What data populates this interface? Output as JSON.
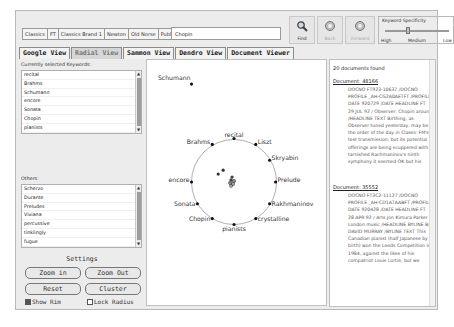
{
  "toolbar": {
    "databases": [
      "Classics",
      "FT",
      "Classics Brand 1",
      "Newton",
      "Old Norse",
      "PubMed"
    ],
    "query_value": "Chopin",
    "find_label": "Find",
    "back_label": "Back",
    "forward_label": "Forward",
    "specificity": {
      "title": "Keyword Specificity",
      "high": "High",
      "medium": "Medium",
      "low": "Low"
    }
  },
  "view_tabs": [
    {
      "label": "Google View",
      "active": false
    },
    {
      "label": "Radial View",
      "active": true
    },
    {
      "label": "Sammon View",
      "active": false
    },
    {
      "label": "Dendro View",
      "active": false
    },
    {
      "label": "Document Viewer",
      "active": false
    }
  ],
  "left": {
    "selected_label": "Currently selected Keywords:",
    "selected": [
      "recital",
      "Brahms",
      "Schumann",
      "encore",
      "Sonata",
      "Chopin",
      "pianists"
    ],
    "others_label": "Others:",
    "others": [
      "Scherzo",
      "Durante",
      "Preludes",
      "Viviana",
      "percussive",
      "tinklingly",
      "fugue"
    ],
    "settings_title": "Settings",
    "zoom_in": "Zoom in",
    "zoom_out": "Zoom Out",
    "reset": "Reset",
    "cluster": "Cluster",
    "show_rim": "Show Rim",
    "show_rim_checked": true,
    "lock_radius": "Lock Radius",
    "lock_radius_checked": false
  },
  "radial": {
    "keywords": [
      {
        "label": "Schumann",
        "x": 45,
        "y": 24
      },
      {
        "label": "recital",
        "x": 88,
        "y": 79
      },
      {
        "label": "Brahms",
        "x": 66,
        "y": 85
      },
      {
        "label": "Liszt",
        "x": 110,
        "y": 85
      },
      {
        "label": "Skryabin",
        "x": 124,
        "y": 101
      },
      {
        "label": "Prelude",
        "x": 130,
        "y": 123
      },
      {
        "label": "encore",
        "x": 45,
        "y": 123
      },
      {
        "label": "Rakhmaninov",
        "x": 124,
        "y": 145
      },
      {
        "label": "Sonata",
        "x": 51,
        "y": 145
      },
      {
        "label": "crystalline",
        "x": 110,
        "y": 160
      },
      {
        "label": "Chopin",
        "x": 66,
        "y": 160
      },
      {
        "label": "pianists",
        "x": 88,
        "y": 166
      }
    ]
  },
  "documents": {
    "found_text": "20 documents found",
    "items": [
      {
        "title": "Document: 48166",
        "body": "DOCNO FT923-10637 /DOCNO PROFILE _AH-CG2A0AETFT /PROFILE DATE 920729 /DATE HEADLINE FT 29 JUL 92 / Observer: Chopin around /HEADLINE TEXT Birthing, as Observer tuned yesterday, may be the order of the day in Classic FM's test transmission; but its potential offerings are being scuppered with tarnished Rachmaninov's ninth symphony it seemed OK but his"
      },
      {
        "title": "Document: 35552",
        "body": "DOCNO FT3C2-11127 /DOCNO PROFILE _AH-CD1A7AABFT /PROFILE DATE 920428 /DATE HEADLINE FT 28 APR 92 / Arts Jon Kimura Parker - London music /HEADLINE BYLINE By DAVID MURRAY /BYLINE TEXT This Canadian pianist (half Japanese by birth) won the Leeds Competition in 1984, against the likes of his compatriot Louis Lortie, but we"
      }
    ]
  }
}
